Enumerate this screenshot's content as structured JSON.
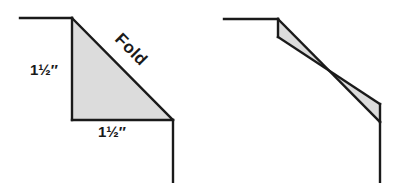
{
  "figure": {
    "background_color": "#ffffff",
    "stroke_color": "#1a1a1a",
    "fill_color": "#dcdcdc",
    "left_diagram": {
      "name": "corner-with-fold-triangle",
      "fold_label": "Fold",
      "vertical_dimension_label": "1½″",
      "horizontal_dimension_label": "1½″"
    },
    "right_diagram": {
      "name": "corner-with-folded-band"
    }
  }
}
